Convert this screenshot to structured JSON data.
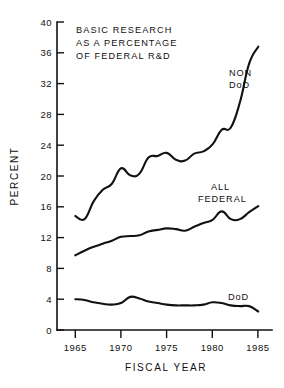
{
  "chart_data": {
    "type": "line",
    "title_lines": [
      "BASIC RESEARCH",
      "AS A PERCENTAGE",
      "OF FEDERAL R&D"
    ],
    "xlabel": "FISCAL YEAR",
    "ylabel": "PERCENT",
    "xlim": [
      1963,
      1986.5
    ],
    "ylim": [
      0,
      40
    ],
    "xticks": [
      1965,
      1970,
      1975,
      1980,
      1985
    ],
    "xtick_labels": [
      "1965",
      "1970",
      "1975",
      "1980",
      "1985"
    ],
    "yticks": [
      0,
      4,
      8,
      12,
      16,
      20,
      24,
      28,
      32,
      36,
      40
    ],
    "ytick_labels": [
      "0",
      "4",
      "8",
      "12",
      "16",
      "20",
      "24",
      "28",
      "32",
      "36",
      "40"
    ],
    "grid": false,
    "legend": "inline-annotations",
    "x": [
      1965,
      1966,
      1967,
      1968,
      1969,
      1970,
      1971,
      1972,
      1973,
      1974,
      1975,
      1976,
      1977,
      1978,
      1979,
      1980,
      1981,
      1982,
      1983,
      1984,
      1985
    ],
    "series": [
      {
        "name": "NON DoD",
        "label": "NON DoD",
        "label_lines": [
          "NON",
          "DoD"
        ],
        "values": [
          14.8,
          14.4,
          16.7,
          18.2,
          19.0,
          21.0,
          20.1,
          20.3,
          22.4,
          22.6,
          23.0,
          22.1,
          22.0,
          22.9,
          23.2,
          24.1,
          26.0,
          26.3,
          29.6,
          34.6,
          36.8
        ]
      },
      {
        "name": "ALL FEDERAL",
        "label": "ALL FEDERAL",
        "label_lines": [
          "ALL",
          "FEDERAL"
        ],
        "values": [
          9.7,
          10.3,
          10.8,
          11.2,
          11.6,
          12.1,
          12.2,
          12.3,
          12.8,
          13.0,
          13.2,
          13.1,
          12.9,
          13.4,
          13.9,
          14.3,
          15.4,
          14.4,
          14.4,
          15.3,
          16.1
        ]
      },
      {
        "name": "DoD",
        "label": "DoD",
        "label_lines": [
          "DoD"
        ],
        "values": [
          4.0,
          3.9,
          3.6,
          3.4,
          3.3,
          3.5,
          4.3,
          4.1,
          3.7,
          3.5,
          3.3,
          3.2,
          3.2,
          3.2,
          3.3,
          3.6,
          3.5,
          3.2,
          3.1,
          3.1,
          2.4
        ]
      }
    ]
  },
  "axes": {
    "y_axis_title": "PERCENT",
    "x_axis_title": "FISCAL YEAR"
  },
  "annotations": {
    "non_dod_line1": "NON",
    "non_dod_line2": "DoD",
    "all_federal_line1": "ALL",
    "all_federal_line2": "FEDERAL",
    "dod": "DoD"
  },
  "title": {
    "line1": "BASIC RESEARCH",
    "line2": "AS A PERCENTAGE",
    "line3": "OF FEDERAL R&D"
  },
  "colors": {
    "ink": "#111111",
    "background": "#ffffff"
  }
}
